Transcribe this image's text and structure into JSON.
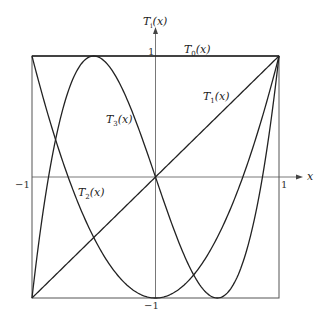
{
  "chart_data": {
    "type": "line",
    "title": "",
    "xlabel": "x",
    "ylabel": "T_i(x)",
    "xlim": [
      -1,
      1
    ],
    "ylim": [
      -1,
      1
    ],
    "grid": false,
    "frame": true,
    "x_ticks": [
      "-1",
      "1"
    ],
    "y_ticks": [
      "1",
      "-1"
    ],
    "series": [
      {
        "name": "T_0(x)",
        "formula": "1",
        "x": [
          -1,
          -0.5,
          0,
          0.5,
          1
        ],
        "values": [
          1,
          1,
          1,
          1,
          1
        ]
      },
      {
        "name": "T_1(x)",
        "formula": "x",
        "x": [
          -1,
          -0.5,
          0,
          0.5,
          1
        ],
        "values": [
          -1,
          -0.5,
          0,
          0.5,
          1
        ]
      },
      {
        "name": "T_2(x)",
        "formula": "2x^2 - 1",
        "x": [
          -1,
          -0.5,
          0,
          0.5,
          1
        ],
        "values": [
          1,
          -0.5,
          -1,
          -0.5,
          1
        ]
      },
      {
        "name": "T_3(x)",
        "formula": "4x^3 - 3x",
        "x": [
          -1,
          -0.5,
          0,
          0.5,
          1
        ],
        "values": [
          -1,
          1,
          0,
          -1,
          1
        ]
      }
    ]
  },
  "labels": {
    "y_axis": {
      "main": "T",
      "sub": "i",
      "arg": "(x)"
    },
    "x_axis": "x",
    "tick_y_top": "1",
    "tick_y_bottom": "−1",
    "tick_x_left": "−1",
    "tick_x_right": "1",
    "t0": {
      "main": "T",
      "sub": "0",
      "arg": "(x)"
    },
    "t1": {
      "main": "T",
      "sub": "1",
      "arg": "(x)"
    },
    "t2": {
      "main": "T",
      "sub": "2",
      "arg": "(x)"
    },
    "t3": {
      "main": "T",
      "sub": "3",
      "arg": "(x)"
    }
  },
  "colors": {
    "line": "#222222",
    "frame": "#555555",
    "axis": "#555555"
  }
}
